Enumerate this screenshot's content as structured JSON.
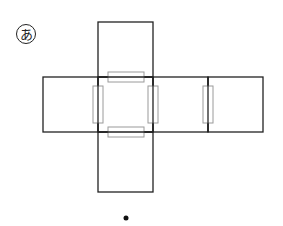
{
  "diagram": {
    "label": "あ",
    "colors": {
      "line": "#222222",
      "tape": "#9a9a9a",
      "background": "#ffffff"
    }
  }
}
